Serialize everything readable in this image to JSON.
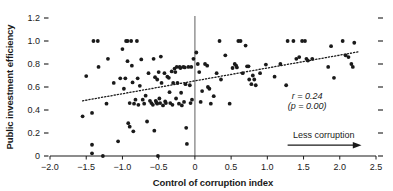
{
  "chart_data": {
    "type": "scatter",
    "title": "",
    "xlabel": "Control of corruption index",
    "ylabel": "Public investment efficiency",
    "xlim": [
      -2.0,
      2.5
    ],
    "ylim": [
      0,
      1.2
    ],
    "xticks": [
      "−2.0",
      "−1.5",
      "−1.0",
      "−0.5",
      "0",
      "0.5",
      "1.0",
      "1.5",
      "2.0",
      "2.5"
    ],
    "xtick_values": [
      -2.0,
      -1.5,
      -1.0,
      -0.5,
      0,
      0.5,
      1.0,
      1.5,
      2.0,
      2.5
    ],
    "yticks": [
      "0",
      "0.2",
      "0.4",
      "0.6",
      "0.8",
      "1.0",
      "1.2"
    ],
    "ytick_values": [
      0,
      0.2,
      0.4,
      0.6,
      0.8,
      1.0,
      1.2
    ],
    "grid": false,
    "legend": "none",
    "marker": "filled-circle",
    "marker_color": "#1a1a1a",
    "trendline": {
      "style": "dotted",
      "color": "#1a1a1a",
      "x_start": -1.55,
      "y_start": 0.48,
      "x_end": 2.25,
      "y_end": 0.905
    },
    "reference_line": {
      "orientation": "vertical",
      "x": 0,
      "color": "#8c8c8c"
    },
    "annotations": [
      {
        "name": "correlation",
        "text": "r = 0.24",
        "x": 1.55,
        "y": 0.5
      },
      {
        "name": "p-value",
        "text": "(p = 0.00)",
        "x": 1.55,
        "y": 0.41
      },
      {
        "name": "direction-arrow-label",
        "text": "Less corruption",
        "x": 1.78,
        "y": 0.155
      }
    ],
    "points": [
      [
        -1.55,
        0.345
      ],
      [
        -1.5,
        0.695
      ],
      [
        -1.42,
        0.375
      ],
      [
        -1.42,
        0.098
      ],
      [
        -1.42,
        0.023
      ],
      [
        -1.4,
        1.0
      ],
      [
        -1.34,
        1.0
      ],
      [
        -1.33,
        0.775
      ],
      [
        -1.27,
        0.0
      ],
      [
        -1.22,
        0.455
      ],
      [
        -1.2,
        0.845
      ],
      [
        -1.12,
        0.635
      ],
      [
        -1.06,
        0.128
      ],
      [
        -1.03,
        0.675
      ],
      [
        -1.0,
        0.93
      ],
      [
        -0.98,
        0.585
      ],
      [
        -0.96,
        0.675
      ],
      [
        -0.95,
        1.0
      ],
      [
        -0.93,
        1.0
      ],
      [
        -0.93,
        0.825
      ],
      [
        -0.92,
        0.285
      ],
      [
        -0.9,
        0.255
      ],
      [
        -0.9,
        0.46
      ],
      [
        -0.88,
        1.0
      ],
      [
        -0.87,
        0.785
      ],
      [
        -0.86,
        0.64
      ],
      [
        -0.85,
        0.215
      ],
      [
        -0.84,
        0.455
      ],
      [
        -0.82,
        0.49
      ],
      [
        -0.8,
        1.0
      ],
      [
        -0.79,
        0.675
      ],
      [
        -0.78,
        0.445
      ],
      [
        -0.76,
        0.61
      ],
      [
        -0.74,
        0.84
      ],
      [
        -0.72,
        0.49
      ],
      [
        -0.7,
        0.455
      ],
      [
        -0.68,
        0.525
      ],
      [
        -0.66,
        0.3
      ],
      [
        -0.64,
        0.72
      ],
      [
        -0.62,
        0.48
      ],
      [
        -0.6,
        0.46
      ],
      [
        -0.58,
        0.445
      ],
      [
        -0.57,
        0.845
      ],
      [
        -0.56,
        0.22
      ],
      [
        -0.55,
        0.685
      ],
      [
        -0.54,
        0.48
      ],
      [
        -0.53,
        0.465
      ],
      [
        -0.52,
        0.455
      ],
      [
        -0.52,
        0.665
      ],
      [
        -0.51,
        0.0
      ],
      [
        -0.5,
        0.73
      ],
      [
        -0.49,
        0.5
      ],
      [
        -0.48,
        0.46
      ],
      [
        -0.47,
        0.865
      ],
      [
        -0.46,
        0.635
      ],
      [
        -0.44,
        0.44
      ],
      [
        -0.42,
        0.72
      ],
      [
        -0.41,
        0.475
      ],
      [
        -0.4,
        0.46
      ],
      [
        -0.38,
        0.69
      ],
      [
        -0.36,
        0.68
      ],
      [
        -0.35,
        0.555
      ],
      [
        -0.34,
        0.46
      ],
      [
        -0.32,
        0.735
      ],
      [
        -0.31,
        0.445
      ],
      [
        -0.3,
        0.635
      ],
      [
        -0.28,
        0.76
      ],
      [
        -0.27,
        0.73
      ],
      [
        -0.26,
        0.5
      ],
      [
        -0.25,
        0.775
      ],
      [
        -0.24,
        0.635
      ],
      [
        -0.22,
        0.455
      ],
      [
        -0.21,
        0.775
      ],
      [
        -0.2,
        0.765
      ],
      [
        -0.19,
        0.55
      ],
      [
        -0.18,
        0.44
      ],
      [
        -0.16,
        0.775
      ],
      [
        -0.15,
        0.47
      ],
      [
        -0.14,
        0.77
      ],
      [
        -0.13,
        0.625
      ],
      [
        -0.12,
        0.245
      ],
      [
        -0.11,
        0.105
      ],
      [
        -0.09,
        0.775
      ],
      [
        -0.07,
        0.615
      ],
      [
        -0.06,
        0.46
      ],
      [
        -0.05,
        0.775
      ],
      [
        -0.04,
        0.49
      ],
      [
        -0.02,
        0.845
      ],
      [
        0.02,
        0.9
      ],
      [
        0.04,
        0.8
      ],
      [
        0.06,
        0.73
      ],
      [
        0.08,
        0.47
      ],
      [
        0.1,
        0.565
      ],
      [
        0.14,
        0.8
      ],
      [
        0.17,
        0.785
      ],
      [
        0.18,
        0.6
      ],
      [
        0.2,
        0.585
      ],
      [
        0.22,
        0.455
      ],
      [
        0.26,
        0.52
      ],
      [
        0.3,
        0.72
      ],
      [
        0.34,
        1.0
      ],
      [
        0.36,
        0.665
      ],
      [
        0.42,
        0.875
      ],
      [
        0.48,
        0.455
      ],
      [
        0.52,
        0.765
      ],
      [
        0.55,
        0.8
      ],
      [
        0.57,
        0.785
      ],
      [
        0.58,
        0.77
      ],
      [
        0.6,
        1.0
      ],
      [
        0.63,
        1.0
      ],
      [
        0.66,
        0.72
      ],
      [
        0.7,
        0.96
      ],
      [
        0.72,
        0.78
      ],
      [
        0.74,
        0.78
      ],
      [
        0.75,
        0.665
      ],
      [
        0.78,
        0.625
      ],
      [
        0.8,
        0.7
      ],
      [
        0.82,
        0.665
      ],
      [
        0.84,
        0.615
      ],
      [
        0.9,
        0.72
      ],
      [
        0.98,
        0.795
      ],
      [
        1.1,
        0.69
      ],
      [
        1.18,
        0.8
      ],
      [
        1.26,
        0.615
      ],
      [
        1.28,
        1.0
      ],
      [
        1.36,
        1.0
      ],
      [
        1.4,
        0.845
      ],
      [
        1.44,
        0.86
      ],
      [
        1.48,
        1.0
      ],
      [
        1.52,
        1.0
      ],
      [
        1.54,
        0.845
      ],
      [
        1.56,
        0.83
      ],
      [
        1.62,
        0.845
      ],
      [
        1.84,
        0.775
      ],
      [
        1.88,
        0.955
      ],
      [
        1.92,
        0.68
      ],
      [
        2.04,
        1.0
      ],
      [
        2.08,
        0.875
      ],
      [
        2.12,
        0.86
      ],
      [
        2.16,
        0.8
      ],
      [
        2.18,
        0.775
      ],
      [
        2.2,
        0.985
      ]
    ]
  }
}
